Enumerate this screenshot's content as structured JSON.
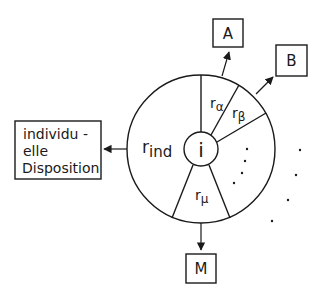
{
  "diagram": {
    "center_label": "i",
    "segments": {
      "ind": {
        "base": "r",
        "sub": "ind"
      },
      "alpha": {
        "base": "r",
        "sub": "α"
      },
      "beta": {
        "base": "r",
        "sub": "β"
      },
      "mu": {
        "base": "r",
        "sub": "μ"
      }
    },
    "boxes": {
      "A": "A",
      "B": "B",
      "M": "M",
      "disposition": [
        "individu -",
        "elle",
        "Disposition"
      ]
    },
    "ellipsis_inside": "· · · ·",
    "ellipsis_outside": "· · · ·"
  }
}
